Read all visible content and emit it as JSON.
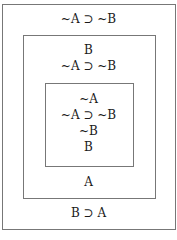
{
  "diagram": {
    "outer_box": {
      "top_lines": [
        "~A ⊃ ~B"
      ],
      "bottom_lines": [
        "B ⊃ A"
      ]
    },
    "middle_box": {
      "top_lines": [
        "B",
        "~A ⊃ ~B"
      ],
      "bottom_lines": [
        "A"
      ]
    },
    "inner_box": {
      "lines": [
        "~A",
        "~A ⊃ ~B",
        "~B",
        "B"
      ]
    },
    "colors": {
      "border": "#777777",
      "text": "#1a1a1a",
      "background": "#ffffff"
    }
  }
}
